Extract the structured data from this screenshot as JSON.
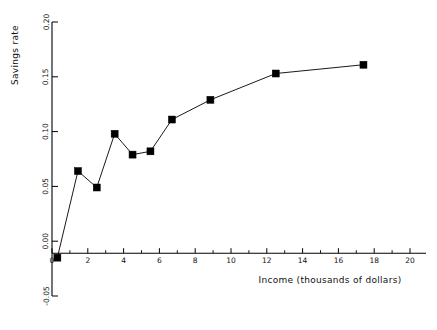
{
  "chart_data": {
    "type": "line",
    "title": "",
    "xlabel": "Income (thousands of dollars)",
    "ylabel": "Savings rate",
    "xlim": [
      0,
      20
    ],
    "ylim": [
      -0.05,
      0.2
    ],
    "xticks": [
      0,
      2,
      4,
      6,
      8,
      10,
      12,
      14,
      16,
      18,
      20
    ],
    "xticklabels": [
      "0",
      "2",
      "4",
      "6",
      "8",
      "10",
      "12",
      "14",
      "16",
      "18",
      "20"
    ],
    "xminorticks": [
      1,
      3,
      5,
      7,
      9,
      11,
      13,
      15,
      17,
      19
    ],
    "yticks": [
      -0.05,
      0.0,
      0.05,
      0.1,
      0.15,
      0.2
    ],
    "yticklabels": [
      "-0.05",
      "0.00",
      "0.05",
      "0.10",
      "0.15",
      "0.20"
    ],
    "grid": false,
    "legend": null,
    "marker": "square",
    "marker_color": "#000000",
    "line_color": "#000000",
    "x": [
      0.3,
      1.45,
      2.5,
      3.5,
      4.5,
      5.5,
      6.7,
      8.85,
      12.5,
      17.4
    ],
    "y": [
      -0.015,
      0.064,
      0.049,
      0.098,
      0.079,
      0.082,
      0.111,
      0.129,
      0.153,
      0.161
    ],
    "series": [
      {
        "name": "Savings rate vs income",
        "points": [
          {
            "x": 0.3,
            "y": -0.015
          },
          {
            "x": 1.45,
            "y": 0.064
          },
          {
            "x": 2.5,
            "y": 0.049
          },
          {
            "x": 3.5,
            "y": 0.098
          },
          {
            "x": 4.5,
            "y": 0.079
          },
          {
            "x": 5.5,
            "y": 0.082
          },
          {
            "x": 6.7,
            "y": 0.111
          },
          {
            "x": 8.85,
            "y": 0.129
          },
          {
            "x": 12.5,
            "y": 0.153
          },
          {
            "x": 17.4,
            "y": 0.161
          }
        ]
      }
    ]
  }
}
